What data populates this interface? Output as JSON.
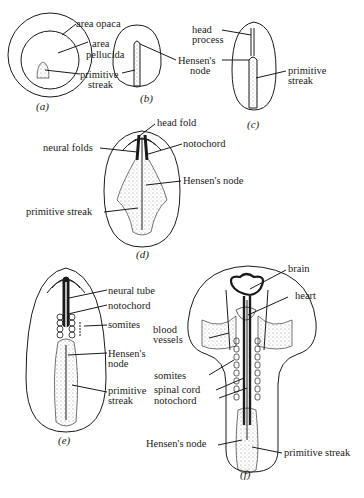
{
  "figure": {
    "type": "diagram",
    "colors": {
      "ink": "#1a1a1a",
      "background": "#ffffff",
      "stipple": "#777777"
    }
  },
  "panels": {
    "a": {
      "caption": "(a)",
      "labels": {
        "area_opaca": "area opaca",
        "area_pellucida_1": "area",
        "area_pellucida_2": "pellucida",
        "primitive_streak_1": "primitive",
        "primitive_streak_2": "streak"
      }
    },
    "b": {
      "caption": "(b)",
      "labels": {
        "hensens_node_1": "Hensen's",
        "hensens_node_2": "node"
      }
    },
    "c": {
      "caption": "(c)",
      "labels": {
        "head_process_1": "head",
        "head_process_2": "process",
        "hensens_node_1": "Hensen's",
        "hensens_node_2": "node",
        "primitive_streak_1": "primitive",
        "primitive_streak_2": "streak"
      }
    },
    "d": {
      "caption": "(d)",
      "labels": {
        "head_fold": "head fold",
        "neural_folds": "neural folds",
        "notochord": "notochord",
        "hensens_node": "Hensen's node",
        "primitive_streak": "primitive streak"
      }
    },
    "e": {
      "caption": "(e)",
      "labels": {
        "neural_tube": "neural tube",
        "notochord": "notochord",
        "somites": "somites",
        "hensens_node_1": "Hensen's",
        "hensens_node_2": "node",
        "primitive_streak_1": "primitive",
        "primitive_streak_2": "streak"
      }
    },
    "f": {
      "caption": "(f)",
      "labels": {
        "brain": "brain",
        "heart": "heart",
        "blood_vessels_1": "blood",
        "blood_vessels_2": "vessels",
        "somites": "somites",
        "spinal_cord": "spinal cord",
        "notochord": "notochord",
        "hensens_node": "Hensen's node",
        "primitive_streak": "primitive streak"
      }
    }
  }
}
